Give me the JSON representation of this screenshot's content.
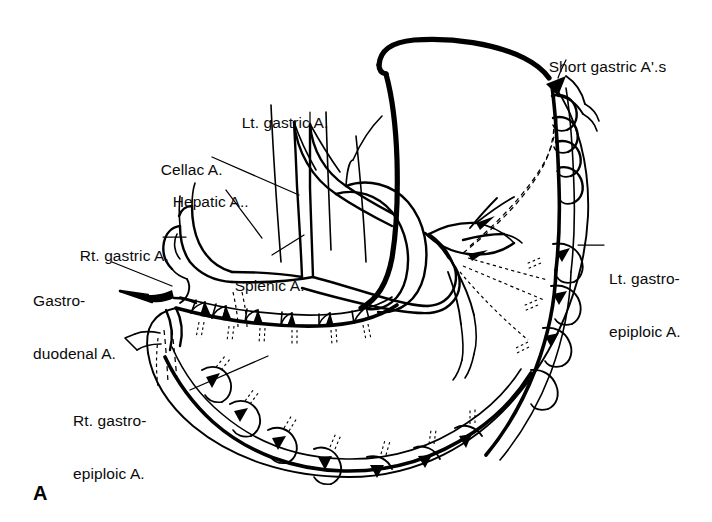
{
  "figure": {
    "panel_letter": "A",
    "ink_color": "#000000",
    "background_color": "#ffffff"
  },
  "labels": [
    {
      "id": "short-gastric",
      "text": "Short gastric A'.s",
      "x": 531,
      "y": 40,
      "align": "left",
      "lines": [
        "Short gastric A'.s"
      ]
    },
    {
      "id": "lt-gastric",
      "text": "Lt. gastric A.",
      "x": 224,
      "y": 96,
      "align": "left",
      "lines": [
        "Lt. gastric A."
      ]
    },
    {
      "id": "celiac",
      "text": "Cellac A.",
      "x": 143,
      "y": 143,
      "align": "left",
      "lines": [
        "Cellac A."
      ]
    },
    {
      "id": "hepatic",
      "text": "Hepatic A..",
      "x": 155,
      "y": 175,
      "align": "left",
      "lines": [
        "Hepatic A.."
      ]
    },
    {
      "id": "rt-gastric",
      "text": "Rt. gastric A.",
      "x": 62,
      "y": 229,
      "align": "left",
      "lines": [
        "Rt. gastric A."
      ]
    },
    {
      "id": "gastroduodenal",
      "text": "Gastro-duodenal A.",
      "x": 33,
      "y": 257,
      "align": "left",
      "lines": [
        "Gastro-",
        "duodenal A."
      ]
    },
    {
      "id": "splenic",
      "text": "Splenic A.",
      "x": 217,
      "y": 259,
      "align": "left",
      "lines": [
        "Splenic A."
      ]
    },
    {
      "id": "lt-gastroepiploic",
      "text": "Lt. gastro-epiploic A.",
      "x": 609,
      "y": 235,
      "align": "left",
      "lines": [
        "Lt. gastro-",
        "epiploic A."
      ]
    },
    {
      "id": "rt-gastroepiploic",
      "text": "Rt. gastro-epiploic A.",
      "x": 73,
      "y": 377,
      "align": "left",
      "lines": [
        "Rt. gastro-",
        "epiploic A."
      ]
    }
  ]
}
